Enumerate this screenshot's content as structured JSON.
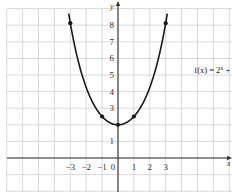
{
  "chart_data": {
    "type": "line",
    "title": "",
    "xlabel": "x",
    "ylabel": "y",
    "xlim": [
      -7,
      7
    ],
    "ylim": [
      -2,
      9
    ],
    "grid": true,
    "x_ticks": [
      "−3",
      "−2",
      "−1",
      "0",
      "1",
      "2",
      "3"
    ],
    "x_tick_values": [
      -3,
      -2,
      -1,
      0,
      1,
      2,
      3
    ],
    "y_ticks": [
      "1",
      "3",
      "4",
      "5",
      "6",
      "7",
      "8"
    ],
    "y_tick_values": [
      1,
      3,
      4,
      5,
      6,
      7,
      8
    ],
    "series": [
      {
        "name": "f(x) = 2^x + 2^(−x)",
        "function": "2^x + 2^-x",
        "domain": [
          -3.1,
          3.1
        ],
        "marked_points": [
          {
            "x": -3,
            "y": 8.125
          },
          {
            "x": -1,
            "y": 2.5
          },
          {
            "x": 0,
            "y": 2
          },
          {
            "x": 1,
            "y": 2.5
          },
          {
            "x": 3,
            "y": 8.125
          }
        ]
      }
    ],
    "annotation": {
      "prefix": "f(x) = 2",
      "sup1": "x",
      "middle": " + 2",
      "sup2": "−x",
      "anchor_x": 4.8,
      "anchor_y": 5.1
    }
  }
}
